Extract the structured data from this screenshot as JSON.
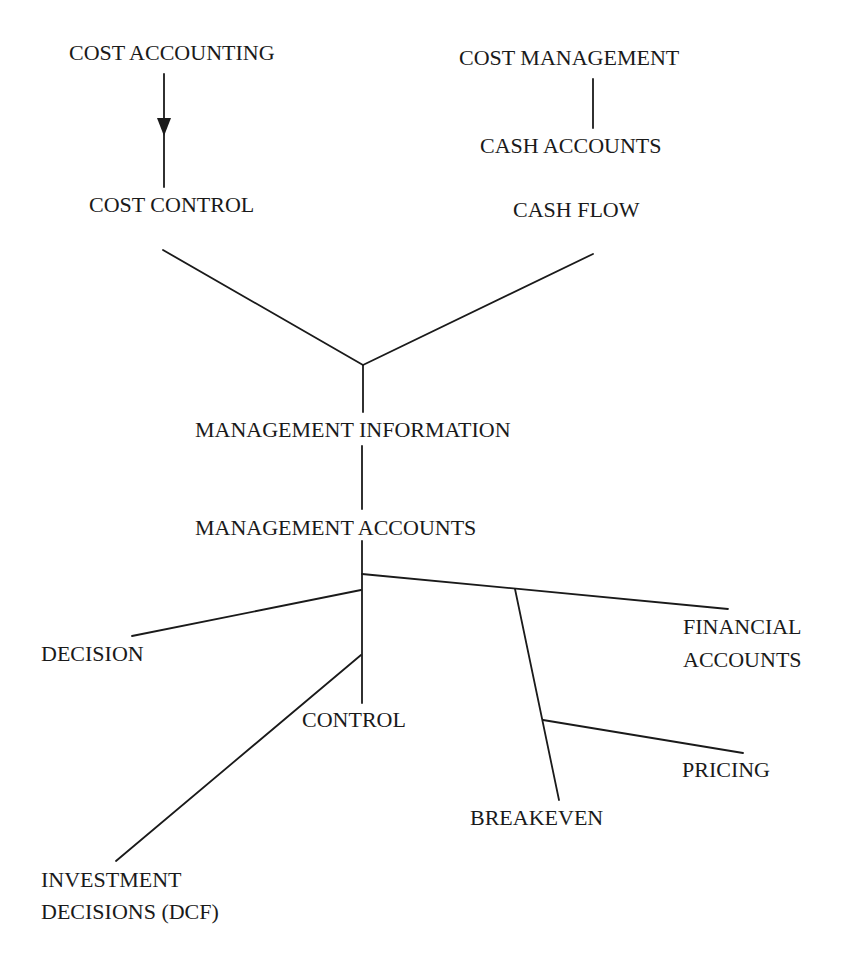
{
  "diagram": {
    "title_fragment": "",
    "nodes": {
      "cost_accounting": "COST ACCOUNTING",
      "cost_control": "COST CONTROL",
      "cost_management": "COST MANAGEMENT",
      "cash_accounts": "CASH ACCOUNTS",
      "cash_flow": "CASH FLOW",
      "management_information": "MANAGEMENT INFORMATION",
      "management_accounts": "MANAGEMENT ACCOUNTS",
      "decision": "DECISION",
      "control": "CONTROL",
      "financial_accounts_line1": "FINANCIAL",
      "financial_accounts_line2": "ACCOUNTS",
      "pricing": "PRICING",
      "breakeven": "BREAKEVEN",
      "investment_line1": "INVESTMENT",
      "investment_line2": "DECISIONS (DCF)"
    },
    "edges": [
      {
        "from": "COST ACCOUNTING",
        "to": "COST CONTROL",
        "arrow": true
      },
      {
        "from": "COST MANAGEMENT",
        "to": "CASH ACCOUNTS",
        "arrow": false
      },
      {
        "from": "COST CONTROL",
        "to": "MANAGEMENT INFORMATION",
        "arrow": false
      },
      {
        "from": "CASH FLOW",
        "to": "MANAGEMENT INFORMATION",
        "arrow": false
      },
      {
        "from": "MANAGEMENT INFORMATION",
        "to": "MANAGEMENT ACCOUNTS",
        "arrow": false
      },
      {
        "from": "MANAGEMENT ACCOUNTS",
        "to": "DECISION",
        "arrow": false
      },
      {
        "from": "MANAGEMENT ACCOUNTS",
        "to": "CONTROL",
        "arrow": false
      },
      {
        "from": "MANAGEMENT ACCOUNTS",
        "to": "INVESTMENT DECISIONS (DCF)",
        "arrow": false
      },
      {
        "from": "MANAGEMENT ACCOUNTS",
        "to": "FINANCIAL ACCOUNTS",
        "arrow": false
      },
      {
        "from": "MANAGEMENT ACCOUNTS",
        "to": "BREAKEVEN",
        "arrow": false
      },
      {
        "from": "BREAKEVEN",
        "to": "PRICING",
        "arrow": false
      }
    ],
    "line_color": "#1a1a1a",
    "text_color": "#1a1a1a"
  }
}
